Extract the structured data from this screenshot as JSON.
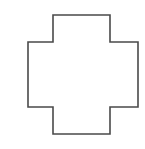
{
  "canvas": {
    "width": 145,
    "height": 149,
    "background_color": "#ffffff"
  },
  "shape": {
    "name": "cross",
    "label": "cross-polygon",
    "fill_color": "#ffffff",
    "stroke_color": "#4a4a4a",
    "stroke_width": 1.6,
    "points": "53,15 110,15 110,42 138,42 138,107 110,107 110,134 53,134 53,107 28,107 28,42 53,42",
    "vertices": [
      [
        53,
        15
      ],
      [
        110,
        15
      ],
      [
        110,
        42
      ],
      [
        138,
        42
      ],
      [
        138,
        107
      ],
      [
        110,
        107
      ],
      [
        110,
        134
      ],
      [
        53,
        134
      ],
      [
        53,
        107
      ],
      [
        28,
        107
      ],
      [
        28,
        42
      ],
      [
        53,
        42
      ]
    ],
    "bounds": {
      "left": 28,
      "top": 15,
      "right": 138,
      "bottom": 134,
      "width": 110,
      "height": 119
    },
    "arms": {
      "top": {
        "x_start": 53,
        "x_end": 110,
        "y_start": 15,
        "y_end": 42
      },
      "bottom": {
        "x_start": 53,
        "x_end": 110,
        "y_start": 107,
        "y_end": 134
      },
      "left": {
        "x_start": 28,
        "x_end": 53,
        "y_start": 42,
        "y_end": 107
      },
      "right": {
        "x_start": 110,
        "x_end": 138,
        "y_start": 42,
        "y_end": 107
      },
      "center": {
        "x_start": 53,
        "x_end": 110,
        "y_start": 42,
        "y_end": 107
      }
    }
  }
}
